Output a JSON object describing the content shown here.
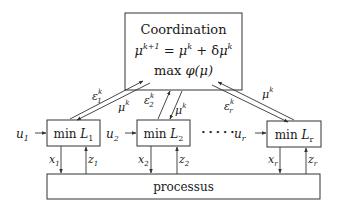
{
  "coordination": {
    "title": "Coordination",
    "update_rule": {
      "lhs_base": "μ",
      "lhs_sup": "k+1",
      "eq": " = ",
      "rhs1_base": "μ",
      "rhs1_sup": "k",
      "plus": " + δ",
      "rhs2_base": "μ",
      "rhs2_sup": "k"
    },
    "objective": {
      "op": "max ",
      "func": "φ(μ)"
    }
  },
  "subsystems": [
    {
      "op": "min ",
      "name": "L",
      "sub": "1",
      "input": {
        "base": "u",
        "sub": "1"
      },
      "x": {
        "base": "x",
        "sub": "1"
      },
      "z": {
        "base": "z",
        "sub": "1"
      },
      "eps": {
        "base": "ε",
        "sub": "1",
        "sup": "k"
      },
      "mu": {
        "base": "μ",
        "sup": "k"
      }
    },
    {
      "op": "min ",
      "name": "L",
      "sub": "2",
      "input": {
        "base": "u",
        "sub": "2"
      },
      "x": {
        "base": "x",
        "sub": "2"
      },
      "z": {
        "base": "z",
        "sub": "2"
      },
      "eps": {
        "base": "ε",
        "sub": "2",
        "sup": "k"
      },
      "mu": {
        "base": "μ",
        "sup": "k"
      }
    },
    {
      "op": "min ",
      "name": "L",
      "sub": "r",
      "input": {
        "base": "u",
        "sub": "r"
      },
      "x": {
        "base": "x",
        "sub": "r"
      },
      "z": {
        "base": "z",
        "sub": "r"
      },
      "eps": {
        "base": "ε",
        "sub": "r",
        "sup": "k"
      },
      "mu": {
        "base": "μ",
        "sup": "k"
      }
    }
  ],
  "ellipsis": "• • • • •",
  "process": {
    "label": "processus"
  },
  "colors": {
    "stroke": "#333333",
    "text": "#1a1a1a",
    "background": "#ffffff"
  }
}
